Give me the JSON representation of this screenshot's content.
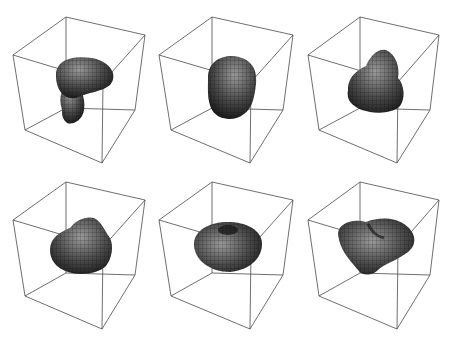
{
  "figure": {
    "layout": {
      "rows": 2,
      "cols": 3
    },
    "colors": {
      "box_edge": "#4a4a4a",
      "surface_dark": "#1a1a1a",
      "surface_mid": "#5a5a5a",
      "surface_light": "#9a9a9a",
      "mesh": "#111111",
      "background": "#ffffff"
    },
    "panels": [
      {
        "id": "panel-1",
        "shape": "two-lobed",
        "x": 0,
        "y": 0
      },
      {
        "id": "panel-2",
        "shape": "egg-upright",
        "x": 150,
        "y": 0
      },
      {
        "id": "panel-3",
        "shape": "peaked-blob",
        "x": 300,
        "y": 0
      },
      {
        "id": "panel-4",
        "shape": "peaked-blob-low",
        "x": 0,
        "y": 172
      },
      {
        "id": "panel-5",
        "shape": "torus-like-dimpled",
        "x": 150,
        "y": 172
      },
      {
        "id": "panel-6",
        "shape": "heart-like-dimpled",
        "x": 300,
        "y": 172
      }
    ]
  }
}
